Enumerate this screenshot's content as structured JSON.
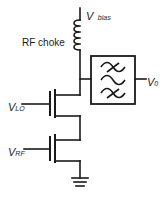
{
  "diagram": {
    "type": "circuit-schematic",
    "colors": {
      "wire": "#1a1a1a",
      "background": "#ffffff"
    },
    "labels": {
      "vbias": {
        "main": "V",
        "sub": "bias"
      },
      "rf_choke": "RF choke",
      "vo": {
        "main": "V",
        "sub": "0"
      },
      "vlo": {
        "main": "V",
        "sub": "LO"
      },
      "vrf": {
        "main": "V",
        "sub": "RF"
      }
    },
    "components": [
      {
        "id": "supply",
        "label": "V bias"
      },
      {
        "id": "inductor",
        "label": "RF choke"
      },
      {
        "id": "filter",
        "label": "band-pass filter"
      },
      {
        "id": "transistor-top",
        "gate": "V LO"
      },
      {
        "id": "transistor-bottom",
        "gate": "V RF"
      },
      {
        "id": "ground"
      }
    ]
  }
}
